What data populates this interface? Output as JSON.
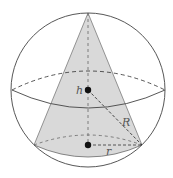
{
  "diagram": {
    "colors": {
      "line": "#444444",
      "cone_fill": "#d9d9d9",
      "background": "#ffffff",
      "point": "#111111"
    },
    "sphere": {
      "cx": 88,
      "cy": 90,
      "r": 77
    },
    "equator": {
      "left": [
        12,
        90
      ],
      "right": [
        165,
        90
      ],
      "back_ctrl_y": 52,
      "front_ctrl_y": 126
    },
    "cone": {
      "apex": [
        88,
        13
      ],
      "base_left": [
        34,
        145
      ],
      "base_right": [
        142,
        145
      ],
      "base_back_ctrl_y": 125,
      "base_front_ctrl_y": 169
    },
    "points": {
      "sphere_center": [
        88,
        90
      ],
      "base_center": [
        88,
        145
      ]
    },
    "labels": {
      "h": {
        "text": "h",
        "x": 76,
        "y": 94
      },
      "R": {
        "text": "R",
        "x": 122,
        "y": 126
      },
      "r": {
        "text": "r",
        "x": 106,
        "y": 155
      }
    }
  }
}
